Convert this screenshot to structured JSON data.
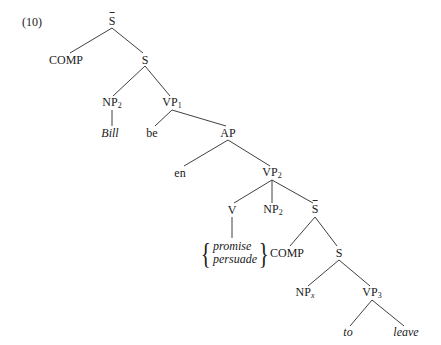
{
  "example_number": "(10)",
  "nodes": {
    "sbar_top": {
      "label": "S",
      "bar": true
    },
    "comp1": {
      "label": "COMP"
    },
    "s1": {
      "label": "S"
    },
    "np2_a": {
      "label": "NP",
      "sub": "2"
    },
    "vp1": {
      "label": "VP",
      "sub": "1"
    },
    "bill": {
      "label": "Bill",
      "italic": true
    },
    "be": {
      "label": "be"
    },
    "ap": {
      "label": "AP"
    },
    "en": {
      "label": "en"
    },
    "vp2": {
      "label": "VP",
      "sub": "2"
    },
    "v": {
      "label": "V"
    },
    "np2_b": {
      "label": "NP",
      "sub": "2"
    },
    "sbar_lower": {
      "label": "S",
      "bar": true
    },
    "verb_options": {
      "items": [
        "promise",
        "persuade"
      ],
      "italic": true
    },
    "comp2": {
      "label": "COMP"
    },
    "s2": {
      "label": "S"
    },
    "npx": {
      "label": "NP",
      "sub": "x"
    },
    "vp3": {
      "label": "VP",
      "sub": "3"
    },
    "to": {
      "label": "to",
      "italic": true
    },
    "leave": {
      "label": "leave",
      "italic": true
    }
  },
  "edges": [
    [
      "sbar_top",
      "comp1"
    ],
    [
      "sbar_top",
      "s1"
    ],
    [
      "s1",
      "np2_a"
    ],
    [
      "s1",
      "vp1"
    ],
    [
      "np2_a",
      "bill"
    ],
    [
      "vp1",
      "be"
    ],
    [
      "vp1",
      "ap"
    ],
    [
      "ap",
      "en"
    ],
    [
      "ap",
      "vp2"
    ],
    [
      "vp2",
      "v"
    ],
    [
      "vp2",
      "np2_b"
    ],
    [
      "vp2",
      "sbar_lower"
    ],
    [
      "v",
      "verb_options"
    ],
    [
      "sbar_lower",
      "comp2"
    ],
    [
      "sbar_lower",
      "s2"
    ],
    [
      "s2",
      "npx"
    ],
    [
      "s2",
      "vp3"
    ],
    [
      "vp3",
      "to"
    ],
    [
      "vp3",
      "leave"
    ]
  ]
}
